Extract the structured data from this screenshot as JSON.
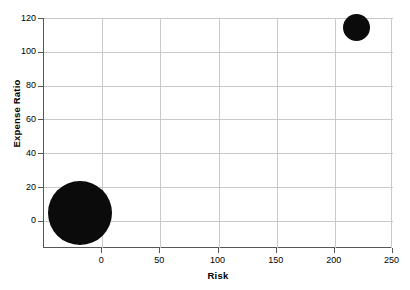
{
  "chart_data": {
    "type": "scatter",
    "title": "",
    "subtitle": "",
    "xlabel": "Risk",
    "ylabel": "Expense Ratio",
    "xlim": [
      -50,
      250
    ],
    "ylim": [
      -20,
      120
    ],
    "xticks": [
      0,
      50,
      100,
      150,
      200,
      250
    ],
    "xticklabels": [
      "0",
      "50",
      "100",
      "150",
      "200",
      "250"
    ],
    "yticks": [
      0,
      20,
      40,
      60,
      80,
      100,
      120
    ],
    "yticklabels": [
      "0",
      "20",
      "40",
      "60",
      "80",
      "100",
      "120"
    ],
    "grid": true,
    "legend": "none",
    "marker_color": "#0b0b0b",
    "points": [
      {
        "label": "large-bubble",
        "x": -19,
        "y": 1,
        "size": 64
      },
      {
        "label": "small-bubble",
        "x": 219,
        "y": 114,
        "size": 27
      }
    ]
  },
  "axes": {
    "x_title": "Risk",
    "y_title": "Expense Ratio"
  }
}
